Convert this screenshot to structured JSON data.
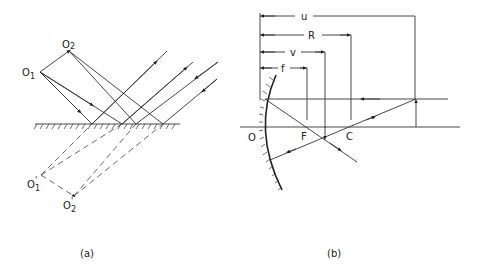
{
  "panel_a": {
    "caption": "(a)",
    "labels": {
      "o1": "O",
      "o1_sub": "1",
      "o2": "O",
      "o2_sub": "2",
      "o1_image": "O",
      "o1_image_sub": "1",
      "o1_image_prime": "'",
      "o2_image": "O",
      "o2_image_sub": "2",
      "o2_image_prime": "'"
    }
  },
  "panel_b": {
    "caption": "(b)",
    "labels": {
      "u": "u",
      "R": "R",
      "v": "v",
      "f": "f",
      "O": "O",
      "F": "F",
      "C": "C"
    }
  }
}
